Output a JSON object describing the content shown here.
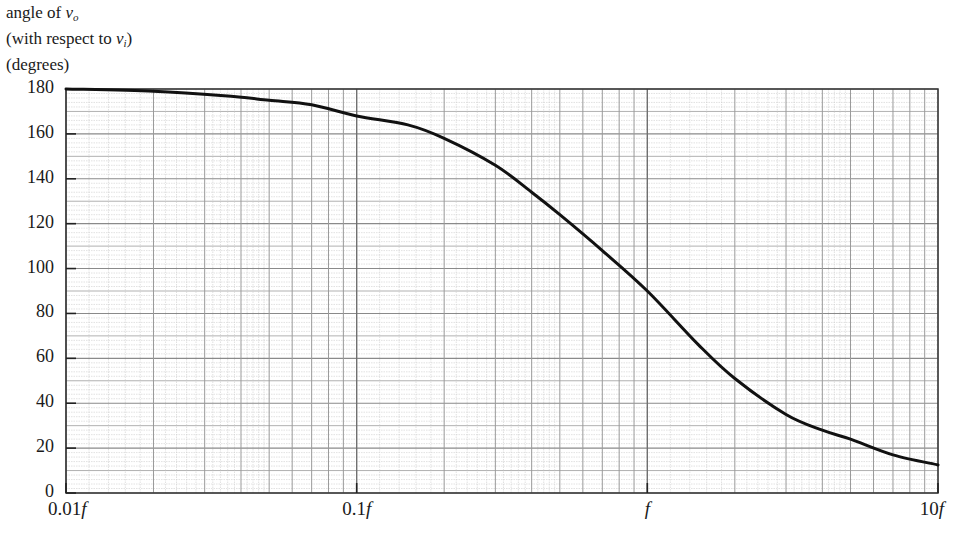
{
  "chart_data": {
    "type": "line",
    "title": "",
    "ylabel_lines": [
      {
        "text": "angle of ",
        "var": "v",
        "sub": "o",
        "suffix": ""
      },
      {
        "text": "(with respect to ",
        "var": "v",
        "sub": "i",
        "suffix": ")"
      },
      {
        "text": "(degrees)",
        "var": "",
        "sub": "",
        "suffix": ""
      }
    ],
    "xlabel": "",
    "xscale": "log",
    "xlim": [
      0.01,
      10
    ],
    "ylim": [
      0,
      180
    ],
    "grid": true,
    "x_ticks": [
      {
        "value": 0.01,
        "label_num": "0.01",
        "label_var": "f"
      },
      {
        "value": 0.1,
        "label_num": "0.1",
        "label_var": "f"
      },
      {
        "value": 1,
        "label_num": "",
        "label_var": "f"
      },
      {
        "value": 10,
        "label_num": "10",
        "label_var": "f"
      }
    ],
    "y_ticks": [
      0,
      20,
      40,
      60,
      80,
      100,
      120,
      140,
      160,
      180
    ],
    "series": [
      {
        "name": "phase",
        "x": [
          0.01,
          0.02,
          0.035,
          0.05,
          0.07,
          0.1,
          0.15,
          0.2,
          0.3,
          0.4,
          0.5,
          0.7,
          1.0,
          1.5,
          2.0,
          3.0,
          4.0,
          5.0,
          7.0,
          10.0
        ],
        "y": [
          180,
          179,
          177,
          175,
          173,
          168,
          164,
          158,
          146,
          134,
          124,
          108,
          90,
          66,
          51,
          35,
          28,
          24,
          17,
          12.5
        ]
      }
    ]
  }
}
